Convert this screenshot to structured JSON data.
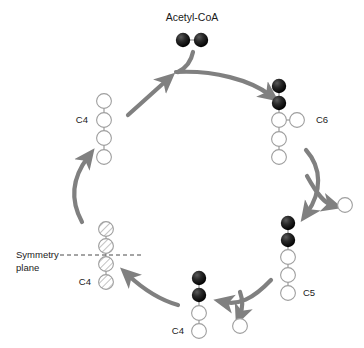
{
  "diagram": {
    "title": "Acetyl-CoA",
    "type": "citric-acid-cycle-carbon-tracing",
    "colors": {
      "arrow": "#808080",
      "atom_outline": "#9e9e9e",
      "atom_open_fill": "#ffffff",
      "atom_labeled_fill": "#111111",
      "hatch": "#c9c9c9",
      "text": "#1a1a1a",
      "dash_line": "#4a4a4a",
      "background": "#ffffff"
    },
    "labels": {
      "acetyl_coa": "Acetyl-CoA",
      "c4_top_left": "C4",
      "c6": "C6",
      "c5": "C5",
      "c4_bottom": "C4",
      "c4_symmetry": "C4",
      "symmetry_line1": "Symmetry",
      "symmetry_line2": "plane"
    },
    "molecules": [
      {
        "name": "acetyl-coa",
        "label": "Acetyl-CoA",
        "orientation": "horizontal",
        "atoms": [
          {
            "state": "labeled"
          },
          {
            "state": "labeled"
          }
        ]
      },
      {
        "name": "c6-citrate",
        "label": "C6",
        "orientation": "vertical",
        "atoms": [
          {
            "state": "labeled"
          },
          {
            "state": "labeled"
          },
          {
            "state": "open",
            "branch": "open"
          },
          {
            "state": "open"
          },
          {
            "state": "open"
          }
        ]
      },
      {
        "name": "c5-alpha-ketoglutarate",
        "label": "C5",
        "orientation": "vertical",
        "atoms": [
          {
            "state": "labeled"
          },
          {
            "state": "labeled"
          },
          {
            "state": "open"
          },
          {
            "state": "open"
          },
          {
            "state": "open"
          }
        ]
      },
      {
        "name": "c4-succinyl",
        "label": "C4",
        "orientation": "vertical",
        "atoms": [
          {
            "state": "labeled"
          },
          {
            "state": "labeled"
          },
          {
            "state": "open"
          },
          {
            "state": "open"
          }
        ]
      },
      {
        "name": "c4-symmetric-succinate",
        "label": "C4",
        "orientation": "vertical",
        "atoms": [
          {
            "state": "hatched"
          },
          {
            "state": "hatched"
          },
          {
            "state": "hatched"
          },
          {
            "state": "hatched"
          }
        ]
      },
      {
        "name": "c4-oxaloacetate",
        "label": "C4",
        "orientation": "vertical",
        "atoms": [
          {
            "state": "open"
          },
          {
            "state": "open"
          },
          {
            "state": "open"
          },
          {
            "state": "open"
          }
        ]
      }
    ],
    "released": [
      {
        "name": "co2-upper-right",
        "state": "open"
      },
      {
        "name": "co2-lower",
        "state": "open"
      }
    ],
    "symmetry_plane": {
      "present": true,
      "label_line1": "Symmetry",
      "label_line2": "plane"
    }
  }
}
